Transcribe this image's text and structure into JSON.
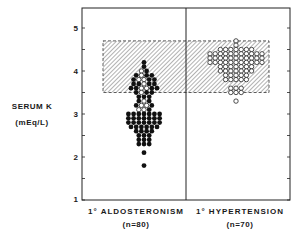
{
  "chart_data": {
    "type": "scatter",
    "subtype": "dot-strip-plot",
    "title": "",
    "ylabel": "SERUM K",
    "ylabel_units": "(mEq/L)",
    "xlabel": "",
    "ylim": [
      1,
      5.5
    ],
    "yticks": [
      1,
      2,
      3,
      4,
      5
    ],
    "minor_yticks": [
      1.5,
      2.5,
      3.5,
      4.5
    ],
    "grid": false,
    "legend": null,
    "normal_range_band": {
      "low": 3.5,
      "high": 4.7,
      "style": "hatched, dashed border"
    },
    "categories": [
      "1° ALDOSTERONISM",
      "1° HYPERTENSION"
    ],
    "category_n": [
      "(n=80)",
      "(n=70)"
    ],
    "series": [
      {
        "name": "1° ALDOSTERONISM",
        "n": 80,
        "marker": "filled circle (some open)",
        "rows": [
          {
            "y": 4.2,
            "filled": 1,
            "open": 0
          },
          {
            "y": 4.1,
            "filled": 1,
            "open": 0
          },
          {
            "y": 4.0,
            "filled": 1,
            "open": 1
          },
          {
            "y": 3.9,
            "filled": 3,
            "open": 1
          },
          {
            "y": 3.8,
            "filled": 3,
            "open": 2
          },
          {
            "y": 3.7,
            "filled": 4,
            "open": 1
          },
          {
            "y": 3.6,
            "filled": 4,
            "open": 2
          },
          {
            "y": 3.5,
            "filled": 3,
            "open": 1
          },
          {
            "y": 3.4,
            "filled": 3,
            "open": 0
          },
          {
            "y": 3.3,
            "filled": 2,
            "open": 1
          },
          {
            "y": 3.2,
            "filled": 2,
            "open": 2
          },
          {
            "y": 3.1,
            "filled": 1,
            "open": 2
          },
          {
            "y": 3.0,
            "filled": 7,
            "open": 0
          },
          {
            "y": 2.9,
            "filled": 7,
            "open": 0
          },
          {
            "y": 2.8,
            "filled": 7,
            "open": 0
          },
          {
            "y": 2.7,
            "filled": 6,
            "open": 0
          },
          {
            "y": 2.6,
            "filled": 4,
            "open": 0
          },
          {
            "y": 2.5,
            "filled": 3,
            "open": 0
          },
          {
            "y": 2.4,
            "filled": 3,
            "open": 0
          },
          {
            "y": 2.3,
            "filled": 3,
            "open": 0
          },
          {
            "y": 2.1,
            "filled": 1,
            "open": 0
          },
          {
            "y": 1.8,
            "filled": 1,
            "open": 0
          }
        ]
      },
      {
        "name": "1° HYPERTENSION",
        "n": 70,
        "marker": "open circle",
        "rows": [
          {
            "y": 4.7,
            "filled": 0,
            "open": 1
          },
          {
            "y": 4.6,
            "filled": 0,
            "open": 1
          },
          {
            "y": 4.5,
            "filled": 0,
            "open": 7
          },
          {
            "y": 4.4,
            "filled": 0,
            "open": 11
          },
          {
            "y": 4.3,
            "filled": 0,
            "open": 11
          },
          {
            "y": 4.2,
            "filled": 0,
            "open": 11
          },
          {
            "y": 4.1,
            "filled": 0,
            "open": 7
          },
          {
            "y": 4.0,
            "filled": 0,
            "open": 7
          },
          {
            "y": 3.9,
            "filled": 0,
            "open": 5
          },
          {
            "y": 3.8,
            "filled": 0,
            "open": 5
          },
          {
            "y": 3.6,
            "filled": 0,
            "open": 3
          },
          {
            "y": 3.5,
            "filled": 0,
            "open": 3
          },
          {
            "y": 3.3,
            "filled": 0,
            "open": 1
          }
        ]
      }
    ]
  },
  "labels": {
    "y_title": "SERUM K",
    "y_units": "(mEq/L)",
    "x_left": "1° ALDOSTERONISM",
    "x_left_n": "(n=80)",
    "x_right": "1° HYPERTENSION",
    "x_right_n": "(n=70)",
    "ticks": [
      "5",
      "4",
      "3",
      "2",
      "1"
    ]
  }
}
